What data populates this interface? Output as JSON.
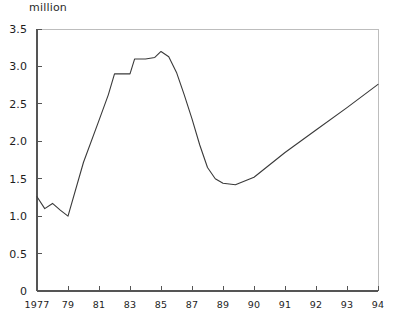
{
  "chart_data": {
    "type": "line",
    "title": "",
    "subtitle": "",
    "unit_label": "million",
    "ylabel": "million",
    "xlabel": "",
    "ylim": [
      0,
      3.5
    ],
    "ytick_values": [
      0,
      0.5,
      1.0,
      1.5,
      2.0,
      2.5,
      3.0,
      3.5
    ],
    "ytick_labels": [
      "0",
      "0.5",
      "1.0",
      "1.5",
      "2.0",
      "2.5",
      "3.0",
      "3.5"
    ],
    "xtick_labels": [
      "1977",
      "79",
      "81",
      "83",
      "85",
      "87",
      "89",
      "90",
      "91",
      "92",
      "93",
      "94"
    ],
    "grid": false,
    "legend": null,
    "line_color": "#3a3a3a",
    "frame_color": "#bdbdbd",
    "axis_color": "#555555",
    "series": [
      {
        "name": "value",
        "x": [
          "1977",
          "1977.5",
          "1978",
          "1978.5",
          "1979",
          "1980",
          "1981",
          "1981.6",
          "1982",
          "1982.4",
          "1983",
          "1983.3",
          "1984",
          "1984.6",
          "1985",
          "1985.5",
          "1986",
          "1986.5",
          "1987",
          "1987.5",
          "1988",
          "1988.5",
          "1989",
          "1989.4",
          "1990",
          "1991",
          "1992",
          "1993",
          "1994"
        ],
        "values": [
          1.26,
          1.1,
          1.17,
          1.08,
          1.0,
          1.72,
          2.28,
          2.62,
          2.9,
          2.9,
          2.9,
          3.1,
          3.1,
          3.12,
          3.2,
          3.13,
          2.92,
          2.62,
          2.3,
          1.95,
          1.65,
          1.5,
          1.44,
          1.42,
          1.52,
          1.85,
          2.15,
          2.45,
          2.76
        ]
      }
    ],
    "annotations": []
  }
}
